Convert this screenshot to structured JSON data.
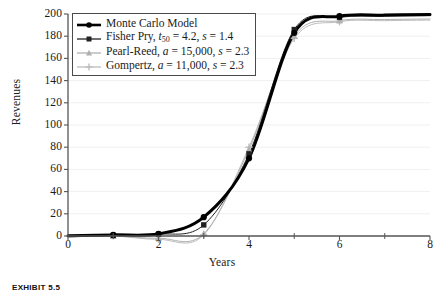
{
  "caption": "EXHIBIT 5.5",
  "chart_data": {
    "type": "line",
    "title": "",
    "xlabel": "Years",
    "ylabel": "Revenues",
    "xlim": [
      0,
      8
    ],
    "ylim": [
      0,
      200
    ],
    "xticks": [
      0,
      2,
      4,
      6,
      8
    ],
    "xtick_labels": [
      "0",
      "2",
      "4",
      "6",
      "8"
    ],
    "xminorticks": [
      1,
      3,
      5,
      7
    ],
    "yticks": [
      0,
      20,
      40,
      60,
      80,
      100,
      120,
      140,
      160,
      180,
      200
    ],
    "ytick_labels": [
      "0",
      "20",
      "40",
      "60",
      "80",
      "100",
      "120",
      "140",
      "160",
      "180",
      "200"
    ],
    "grid": "horizontal-faint",
    "legend_position": "upper-left",
    "series": [
      {
        "name": "Monte Carlo Model",
        "legend_label": "Monte Carlo Model",
        "marker": "circle",
        "color": "#000000",
        "linewidth": 3,
        "x": [
          1,
          2,
          3,
          4,
          5,
          6
        ],
        "y": [
          1,
          2,
          17,
          70,
          183,
          198
        ]
      },
      {
        "name": "Fisher Pry",
        "legend_label": "Fisher Pry, t50 = 4.2, s = 1.4",
        "legend_label_prefix": "Fisher Pry, ",
        "legend_t50_symbol": "t",
        "legend_t50_sub": "50",
        "legend_label_rest": " = 4.2, s = 1.4",
        "t50": 4.2,
        "s": 1.4,
        "marker": "square",
        "color": "#222222",
        "linewidth": 1,
        "x": [
          1,
          2,
          3,
          4,
          5,
          6
        ],
        "y": [
          0.5,
          1.5,
          10,
          74,
          186,
          197
        ]
      },
      {
        "name": "Pearl-Reed",
        "legend_label": "Pearl-Reed, a = 15,000, s = 2.3",
        "legend_label_prefix": "Pearl-Reed, ",
        "legend_a_symbol": "a",
        "legend_label_rest": " = 15,000, s = 2.3",
        "a": 15000,
        "s": 2.3,
        "marker": "triangle",
        "color": "#b0b0b0",
        "linewidth": 1,
        "x": [
          1,
          2,
          3,
          4,
          5,
          6
        ],
        "y": [
          0,
          -2,
          2,
          78,
          180,
          194
        ]
      },
      {
        "name": "Gompertz",
        "legend_label": "Gompertz, a = 11,000, s = 2.3",
        "legend_label_prefix": "Gompertz, ",
        "legend_a_symbol": "a",
        "legend_label_rest": " = 11,000, s = 2.3",
        "a": 11000,
        "s": 2.3,
        "marker": "plus",
        "color": "#bdbdbd",
        "linewidth": 1,
        "x": [
          1,
          2,
          3,
          4,
          5,
          6
        ],
        "y": [
          0,
          -3,
          1,
          80,
          178,
          193
        ]
      }
    ],
    "colors": {
      "axis": "#555555",
      "grid": "#f0f0f0",
      "monte_carlo": "#000000",
      "fisher_pry": "#222222",
      "pearl_reed": "#b0b0b0",
      "gompertz": "#bdbdbd",
      "legend_border": "#4a4a4a",
      "text": "#1a1a1a"
    }
  }
}
